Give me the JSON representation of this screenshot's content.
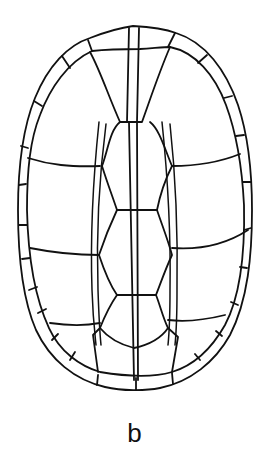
{
  "figure": {
    "label": "b",
    "stroke_color": "#111111",
    "background": "#ffffff"
  }
}
